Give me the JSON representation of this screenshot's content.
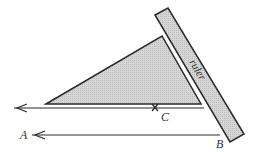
{
  "diagram": {
    "type": "geometry-construction",
    "labels": {
      "ruler": "ruler",
      "point_a": "A",
      "point_b": "B",
      "point_c": "C"
    },
    "colors": {
      "stroke": "#2a2a2a",
      "fill_triangle": "#cfcfcf",
      "fill_ruler": "#d4d4d4",
      "text": "#333333"
    }
  }
}
